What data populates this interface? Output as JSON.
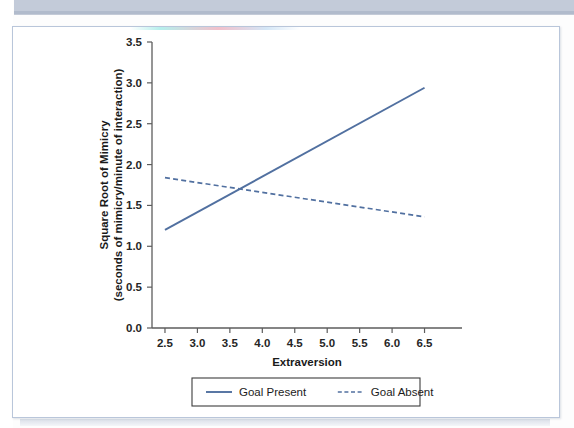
{
  "figure": {
    "border_color": "#b9c6da",
    "background": "#ffffff"
  },
  "page": {
    "top_band_color": "#c3cbd9"
  },
  "chart_data": {
    "type": "line",
    "title": "",
    "xlabel": "Extraversion",
    "ylabel": "Square Root of Mimicry (seconds of mimicry/minute of interaction)",
    "ylabel_line1": "Square Root of Mimicry",
    "ylabel_line2": "(seconds of mimicry/minute of interaction)",
    "x": [
      2.5,
      6.5
    ],
    "xlim": [
      2.3,
      6.8
    ],
    "ylim": [
      0.0,
      3.5
    ],
    "xticks": [
      "2.5",
      "3.0",
      "3.5",
      "4.0",
      "4.5",
      "5.0",
      "5.5",
      "6.0",
      "6.5"
    ],
    "xtick_values": [
      2.5,
      3.0,
      3.5,
      4.0,
      4.5,
      5.0,
      5.5,
      6.0,
      6.5
    ],
    "yticks": [
      "0.0",
      "0.5",
      "1.0",
      "1.5",
      "2.0",
      "2.5",
      "3.0",
      "3.5"
    ],
    "ytick_values": [
      0.0,
      0.5,
      1.0,
      1.5,
      2.0,
      2.5,
      3.0,
      3.5
    ],
    "grid": false,
    "legend_position": "below-axes",
    "series": [
      {
        "name": "Goal Present",
        "style": "solid",
        "color": "#5170a0",
        "x": [
          2.5,
          6.5
        ],
        "values": [
          1.2,
          2.94
        ]
      },
      {
        "name": "Goal Absent",
        "style": "dashed",
        "color": "#5170a0",
        "x": [
          2.5,
          6.5
        ],
        "values": [
          1.84,
          1.36
        ]
      }
    ],
    "annotations": []
  }
}
